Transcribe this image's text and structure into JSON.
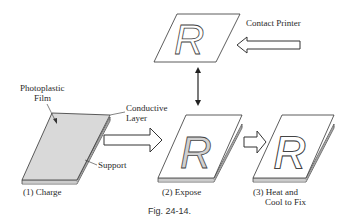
{
  "figure": {
    "caption": "Fig. 24-14.",
    "labels": {
      "contact_printer": "Contact Printer",
      "photoplastic_film_line1": "Photoplastic",
      "photoplastic_film_line2": "Film",
      "conductive_layer_line1": "Conductive",
      "conductive_layer_line2": "Layer",
      "support": "Support"
    },
    "steps": [
      {
        "label": "(1)  Charge"
      },
      {
        "label": "(2)  Expose"
      },
      {
        "label_line1": "(3) Heat and",
        "label_line2": "Cool to Fix"
      }
    ],
    "mask_letter": "R",
    "colors": {
      "line": "#333333",
      "film_fill": "#d9d9d9",
      "letter_fill": "#d0d0d0"
    }
  }
}
